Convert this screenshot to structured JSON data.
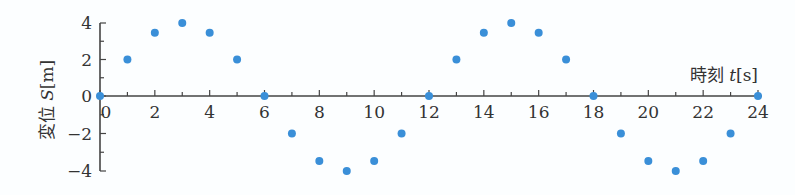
{
  "chart_data": {
    "type": "scatter",
    "title": "",
    "xlabel": "時刻 t[s]",
    "ylabel": "変位 S[m]",
    "x_ticks": [
      0,
      2,
      4,
      6,
      8,
      10,
      12,
      14,
      16,
      18,
      20,
      22,
      24
    ],
    "y_ticks": [
      4,
      2,
      0,
      -2,
      -4
    ],
    "xlim": [
      0,
      24
    ],
    "ylim": [
      -4,
      4
    ],
    "grid": false,
    "legend": null,
    "series": [
      {
        "name": "S",
        "color": "#3a8fd8",
        "x": [
          0,
          1,
          2,
          3,
          4,
          5,
          6,
          7,
          8,
          9,
          10,
          11,
          12,
          13,
          14,
          15,
          16,
          17,
          18,
          19,
          20,
          21,
          22,
          23,
          24
        ],
        "y": [
          0,
          2,
          3.46,
          4,
          3.46,
          2,
          0,
          -2,
          -3.46,
          -4,
          -3.46,
          -2,
          0,
          2,
          3.46,
          4,
          3.46,
          2,
          0,
          -2,
          -3.46,
          -4,
          -3.46,
          -2,
          0
        ]
      }
    ]
  },
  "labels": {
    "xlabel_kanji": "時刻",
    "xlabel_var": "t",
    "xlabel_unit": "[s]",
    "ylabel_kanji": "変位",
    "ylabel_var": "S",
    "ylabel_unit": "[m]"
  }
}
